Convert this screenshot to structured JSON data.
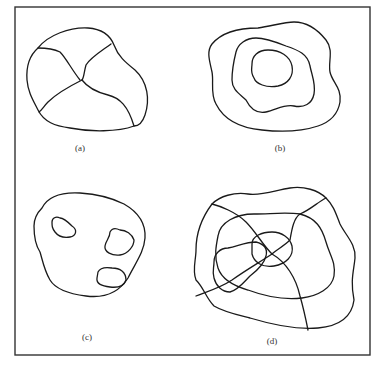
{
  "figure": {
    "panels": [
      {
        "id": "a",
        "label": "(a)",
        "description": "closed region divided into four sub-regions by internal boundaries"
      },
      {
        "id": "b",
        "label": "(b)",
        "description": "three nested concentric irregular contours"
      },
      {
        "id": "c",
        "label": "(c)",
        "description": "closed region containing three hatched islands"
      },
      {
        "id": "d",
        "label": "(d)",
        "description": "overlay of partitioned region, nested contours and a hatched patch"
      }
    ]
  },
  "colors": {
    "line": "#1a1a1a",
    "frame": "#333333",
    "background": "#ffffff"
  }
}
